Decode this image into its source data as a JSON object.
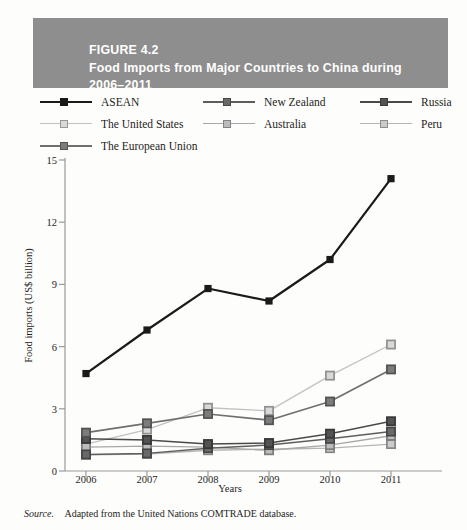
{
  "figure": {
    "label": "FIGURE 4.2",
    "title_line1": "Food Imports from Major Countries to China during",
    "title_line2": "2006–2011",
    "banner_color": "#8e8e8e"
  },
  "source": {
    "word": "Source.",
    "text": "Adapted from the United Nations COMTRADE database."
  },
  "chart_data": {
    "type": "line",
    "title": "Food Imports from Major Countries to China during 2006–2011",
    "xlabel": "Years",
    "ylabel": "Food imports (US$ billion)",
    "categories": [
      "2006",
      "2007",
      "2008",
      "2009",
      "2010",
      "2011"
    ],
    "x_ticks": [
      "2006",
      "2007",
      "2008",
      "2009",
      "2010",
      "2011"
    ],
    "y_ticks": [
      "0",
      "3",
      "6",
      "9",
      "12",
      "15"
    ],
    "ylim": [
      0,
      15
    ],
    "grid": false,
    "legend_position": "top",
    "series": [
      {
        "name": "ASEAN",
        "values": [
          4.7,
          6.8,
          8.8,
          8.2,
          10.2,
          14.1
        ],
        "color": "#1a1a1a",
        "marker": "filled-square",
        "width": 2.2
      },
      {
        "name": "New Zealand",
        "values": [
          0.8,
          0.85,
          1.1,
          1.25,
          1.55,
          1.9
        ],
        "color": "#5e5e5e",
        "marker": "square",
        "width": 1.5
      },
      {
        "name": "Russia",
        "values": [
          1.55,
          1.5,
          1.3,
          1.35,
          1.8,
          2.4
        ],
        "color": "#4a4a4a",
        "marker": "square",
        "width": 1.5
      },
      {
        "name": "The United States",
        "values": [
          1.3,
          2.0,
          3.05,
          2.9,
          4.6,
          6.1
        ],
        "color": "#c2c2c2",
        "marker": "square",
        "width": 1.3
      },
      {
        "name": "Australia",
        "values": [
          1.15,
          1.2,
          1.15,
          1.0,
          1.25,
          1.7
        ],
        "color": "#a8a8a8",
        "marker": "square",
        "width": 1.3
      },
      {
        "name": "Peru",
        "values": [
          0.78,
          0.82,
          1.0,
          1.05,
          1.1,
          1.3
        ],
        "color": "#b5b5b5",
        "marker": "square",
        "width": 1.3
      },
      {
        "name": "The European Union",
        "values": [
          1.85,
          2.3,
          2.75,
          2.45,
          3.35,
          4.9
        ],
        "color": "#6f6f6f",
        "marker": "square",
        "width": 1.7
      }
    ]
  }
}
